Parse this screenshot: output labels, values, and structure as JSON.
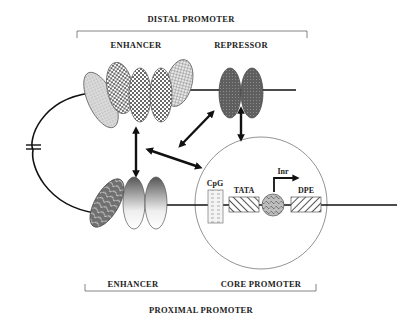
{
  "labels": {
    "distal_promoter": "DISTAL  PROMOTER",
    "distal_enhancer": "ENHANCER",
    "repressor": "REPRESSOR",
    "proximal_enhancer": "ENHANCER",
    "core_promoter": "CORE  PROMOTER",
    "proximal_promoter": "PROXIMAL  PROMOTER",
    "cpg": "CpG",
    "tata": "TATA",
    "inr": "Inr",
    "dpe": "DPE"
  },
  "colors": {
    "line": "#111111",
    "circle_outline": "#777777",
    "repressor_fill": "#6b6b6b",
    "checker_dark": "#777777",
    "light_stipple": "#cfcfcf"
  }
}
